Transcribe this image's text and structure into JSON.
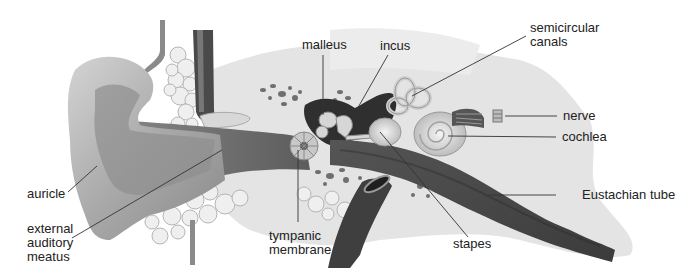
{
  "diagram": {
    "labels": {
      "auricle": "auricle",
      "external_auditory_meatus": [
        "external",
        "auditory",
        "meatus"
      ],
      "malleus": "malleus",
      "incus": "incus",
      "semicircular_canals": [
        "semicircular",
        "canals"
      ],
      "nerve": "nerve",
      "cochlea": "cochlea",
      "eustachian_tube": "Eustachian tube",
      "tympanic_membrane": [
        "tympanic",
        "membrane"
      ],
      "stapes": "stapes"
    },
    "colors": {
      "skin": "#b9b9b9",
      "skin_dark": "#7a7a7a",
      "canal": "#6e6e6e",
      "bone": "#e2e2e2",
      "vessel": "#3a3a3a",
      "fat": "#ececec",
      "leader": "#333333",
      "text": "#222222"
    }
  }
}
